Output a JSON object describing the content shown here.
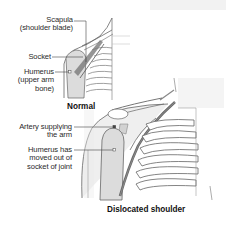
{
  "diagram": {
    "panels": [
      {
        "caption": "Normal",
        "labels": [
          {
            "line1": "Scapula",
            "line2": "(shoulder blade)"
          },
          {
            "line1": "Socket"
          },
          {
            "line1": "Humerus",
            "line2": "(upper arm",
            "line3": "bone)"
          }
        ]
      },
      {
        "caption": "Dislocated shoulder",
        "labels": [
          {
            "line1": "Artery supplying",
            "line2": "the arm"
          },
          {
            "line1": "Humerus has",
            "line2": "moved out of",
            "line3": "socket of joint"
          }
        ]
      }
    ],
    "colors": {
      "line": "#555555",
      "bone_shade": "#d9d9d9",
      "skin_bg": "#efefef",
      "artery": "#666666",
      "text": "#2b2b2b"
    }
  }
}
